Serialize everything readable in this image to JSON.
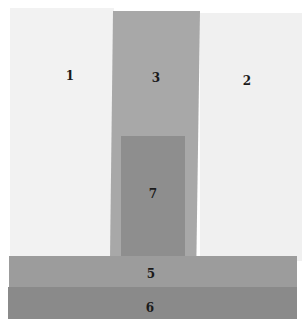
{
  "diagram": {
    "title": "",
    "regions": [
      {
        "id": "1",
        "label": "1",
        "color": "#f2f2f2"
      },
      {
        "id": "2",
        "label": "2",
        "color": "#f0f0f0"
      },
      {
        "id": "3",
        "label": "3",
        "color": "#a8a8a8"
      },
      {
        "id": "7",
        "label": "7",
        "color": "#8e8e8e"
      },
      {
        "id": "5",
        "label": "5",
        "color": "#9c9c9c"
      },
      {
        "id": "6",
        "label": "6",
        "color": "#8a8a8a"
      }
    ]
  }
}
